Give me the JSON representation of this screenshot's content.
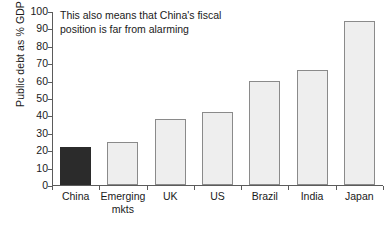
{
  "chart_data": {
    "type": "bar",
    "title": "",
    "xlabel": "",
    "ylabel": "Public debt as % GDP",
    "ylim": [
      0,
      100
    ],
    "ytick_step": 10,
    "grid": false,
    "legend": "none",
    "categories": [
      "China",
      "Emerging mkts",
      "UK",
      "US",
      "Brazil",
      "India",
      "Japan"
    ],
    "values": [
      22,
      25,
      38,
      42,
      60,
      66,
      94
    ],
    "ytick_labels": [
      "0",
      "10",
      "20",
      "30",
      "40",
      "50",
      "60",
      "70",
      "80",
      "90",
      "100"
    ],
    "annotations": [
      {
        "name": "fiscal-position-note",
        "lines": [
          "This also means that China's fiscal",
          "position is far from alarming"
        ]
      }
    ],
    "highlight_category": "China",
    "colors": {
      "bar_fill": "#eeeeee",
      "bar_stroke": "#8a8a8a",
      "highlight_fill": "#2b2b2b",
      "axis": "#5b5b5b",
      "text": "#1a1a1a",
      "background": "#ffffff"
    }
  },
  "category_labels": [
    {
      "line1": "China",
      "line2": ""
    },
    {
      "line1": "Emerging",
      "line2": "mkts"
    },
    {
      "line1": "UK",
      "line2": ""
    },
    {
      "line1": "US",
      "line2": ""
    },
    {
      "line1": "Brazil",
      "line2": ""
    },
    {
      "line1": "India",
      "line2": ""
    },
    {
      "line1": "Japan",
      "line2": ""
    }
  ],
  "annotation_line_1": "This also means that China's fiscal",
  "annotation_line_2": "position is far from alarming"
}
